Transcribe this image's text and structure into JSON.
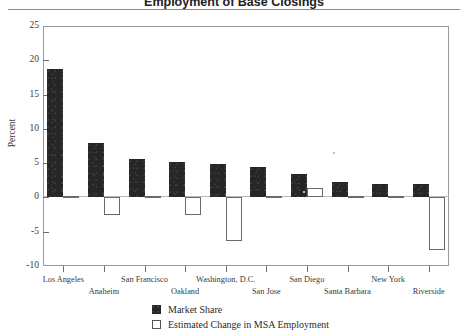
{
  "chart_data": {
    "type": "bar",
    "title": "Employment of Base Closings",
    "xlabel": "",
    "ylabel": "Percent",
    "ylim": [
      -10,
      25
    ],
    "yticks": [
      -10,
      -5,
      0,
      5,
      10,
      15,
      20,
      25
    ],
    "ytick_labels": [
      "-10",
      "-5",
      "0",
      "5",
      "10",
      "15",
      "20",
      "25"
    ],
    "grid": false,
    "legend_position": "bottom-center",
    "categories": [
      "Los Angeles",
      "Anaheim",
      "San Francisco",
      "Oakland",
      "Washington, D.C.",
      "San Jose",
      "San Diego",
      "Santa Barbara",
      "New York",
      "Riverside"
    ],
    "series": [
      {
        "name": "Market Share",
        "color": "#262626",
        "values": [
          18.8,
          7.9,
          5.6,
          5.1,
          4.9,
          4.5,
          3.4,
          2.3,
          1.9,
          2.0
        ]
      },
      {
        "name": "Estimated Change in MSA Employment",
        "color": "#ffffff",
        "values": [
          -0.1,
          -2.6,
          -0.1,
          -2.5,
          -6.3,
          -0.15,
          1.4,
          -0.1,
          0.15,
          -7.6
        ]
      }
    ]
  },
  "axes": {
    "y_axis_title": "Percent"
  },
  "legend": {
    "items": [
      {
        "label": "Market Share",
        "swatch": "filled-dark-square"
      },
      {
        "label": "Estimated Change in MSA Employment",
        "swatch": "outlined-white-square"
      }
    ]
  },
  "colors": {
    "market_share": "#262626",
    "employment_change_fill": "#ffffff",
    "employment_change_stroke": "#6a6a6a",
    "axis": "#9a9a9a",
    "text": "#2b2b2b"
  }
}
